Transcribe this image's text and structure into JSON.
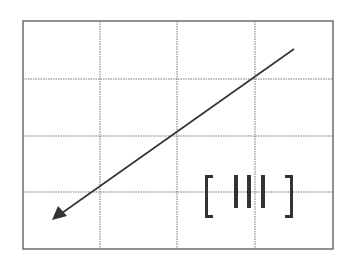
{
  "diagram": {
    "frame": {
      "x": 23,
      "y": 21,
      "width": 310,
      "height": 228
    },
    "grid": {
      "columns": 4,
      "rows": 4,
      "line_style": "dotted"
    },
    "arrow": {
      "from": [
        294,
        49
      ],
      "to": [
        52,
        220
      ],
      "direction": "down-left"
    },
    "symbol": {
      "label": "[ III ]",
      "bar_count": 3
    },
    "colors": {
      "line": "#333333",
      "grid": "#777777",
      "background": "#ffffff"
    }
  }
}
